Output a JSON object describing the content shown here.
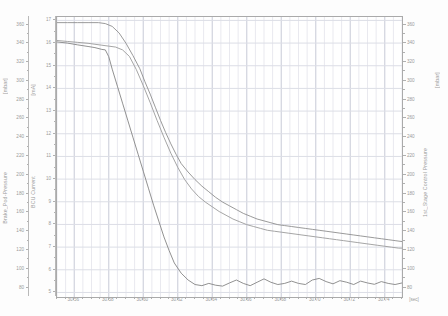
{
  "chart_data": {
    "type": "line",
    "title": "",
    "xlabel": "[sec]",
    "xlim": [
      30.55,
      30.75
    ],
    "x_ticks": [
      "30.56",
      "30.58",
      "30.60",
      "30.62",
      "30.64",
      "30.66",
      "30.68",
      "30.70",
      "30.72",
      "30.74"
    ],
    "x_tick_values": [
      30.56,
      30.58,
      30.6,
      30.62,
      30.64,
      30.66,
      30.68,
      30.7,
      30.72,
      30.74
    ],
    "x_minor_step": 0.005,
    "grid": true,
    "legend": "none",
    "axes": [
      {
        "id": "left-outer",
        "name": "Brake_Pod-Pressure",
        "label": "Brake_Pod-Pressure",
        "unit": "[mbar]",
        "side": "left",
        "lim": [
          70,
          368
        ],
        "ticks": [
          360,
          340,
          320,
          300,
          280,
          260,
          240,
          220,
          200,
          180,
          160,
          140,
          120,
          100,
          80
        ],
        "tick_labels": [
          "360",
          "340",
          "320",
          "300",
          "280",
          "260",
          "240",
          "220",
          "200",
          "180",
          "160",
          "140",
          "120",
          "100",
          "80"
        ]
      },
      {
        "id": "left-inner",
        "name": "BCU Current",
        "label": "BCU Current",
        "unit": "[mA]",
        "side": "left",
        "lim": [
          4.8,
          17.15
        ],
        "ticks": [
          17,
          16,
          15,
          14,
          13,
          12,
          11,
          10,
          9,
          8,
          7,
          6,
          5
        ],
        "tick_labels": [
          "17",
          "16",
          "15",
          "14",
          "13",
          "12",
          "11",
          "10",
          "9",
          "8",
          "7",
          "6",
          "5"
        ]
      },
      {
        "id": "right",
        "name": "1st_Stage Control Pressure",
        "label": "1st_Stage Control Pressure",
        "unit": "[mbar]",
        "side": "right",
        "lim": [
          70,
          368
        ],
        "ticks": [
          360,
          340,
          320,
          300,
          280,
          260,
          240,
          220,
          200,
          180,
          160,
          140,
          120,
          100,
          80
        ],
        "tick_labels": [
          "360",
          "340",
          "320",
          "300",
          "280",
          "260",
          "240",
          "220",
          "200",
          "180",
          "160",
          "140",
          "120",
          "100",
          "80"
        ]
      }
    ],
    "series": [
      {
        "name": "Brake_Pod-Pressure",
        "axis": "left-outer",
        "color": "#8e8e8e",
        "x": [
          30.55,
          30.556,
          30.562,
          30.568,
          30.574,
          30.578,
          30.582,
          30.586,
          30.59,
          30.594,
          30.598,
          30.601,
          30.604,
          30.607,
          30.61,
          30.613,
          30.616,
          30.619,
          30.622,
          30.626,
          30.63,
          30.634,
          30.638,
          30.642,
          30.646,
          30.65,
          30.654,
          30.658,
          30.662,
          30.666,
          30.67,
          30.674,
          30.678,
          30.682,
          30.686,
          30.69,
          30.694,
          30.698,
          30.702,
          30.706,
          30.71,
          30.714,
          30.718,
          30.722,
          30.726,
          30.73,
          30.734,
          30.738,
          30.742,
          30.746,
          30.75
        ],
        "y": [
          362,
          362,
          362,
          362,
          362,
          361,
          358,
          351,
          340,
          327,
          313,
          299,
          286,
          272,
          258,
          245,
          233,
          222,
          212,
          203,
          195,
          188,
          182,
          176,
          171,
          167,
          163,
          159,
          156,
          153,
          151,
          149,
          147,
          146,
          145,
          144,
          143,
          142,
          141,
          140,
          139,
          138,
          137,
          136,
          135,
          134,
          133,
          132,
          131,
          130,
          129
        ]
      },
      {
        "name": "1st_Stage Control Pressure",
        "axis": "right",
        "color": "#9b9b9b",
        "x": [
          30.55,
          30.556,
          30.562,
          30.568,
          30.572,
          30.576,
          30.58,
          30.584,
          30.588,
          30.592,
          30.596,
          30.6,
          30.604,
          30.608,
          30.612,
          30.616,
          30.62,
          30.624,
          30.628,
          30.632,
          30.636,
          30.64,
          30.644,
          30.648,
          30.652,
          30.656,
          30.66,
          30.664,
          30.668,
          30.672,
          30.676,
          30.68,
          30.684,
          30.688,
          30.692,
          30.696,
          30.7,
          30.704,
          30.708,
          30.712,
          30.716,
          30.72,
          30.724,
          30.728,
          30.732,
          30.736,
          30.74,
          30.744,
          30.748,
          30.75
        ],
        "y": [
          343,
          342,
          341,
          340,
          339,
          338,
          337,
          336,
          333,
          326,
          312,
          295,
          277,
          258,
          240,
          223,
          208,
          195,
          185,
          177,
          171,
          166,
          161,
          157,
          153,
          150,
          147,
          145,
          143,
          141,
          140,
          139,
          138,
          137,
          136,
          135,
          134,
          133,
          132,
          131,
          130,
          129,
          128,
          127,
          126,
          125,
          124,
          123,
          122,
          122
        ]
      },
      {
        "name": "BCU Current",
        "axis": "left-inner",
        "color": "#858585",
        "x": [
          30.55,
          30.556,
          30.562,
          30.568,
          30.572,
          30.576,
          30.578,
          30.58,
          30.582,
          30.585,
          30.588,
          30.591,
          30.594,
          30.597,
          30.6,
          30.603,
          30.606,
          30.609,
          30.612,
          30.615,
          30.618,
          30.622,
          30.626,
          30.63,
          30.634,
          30.638,
          30.642,
          30.646,
          30.65,
          30.654,
          30.658,
          30.662,
          30.666,
          30.67,
          30.674,
          30.678,
          30.682,
          30.686,
          30.69,
          30.694,
          30.698,
          30.702,
          30.706,
          30.71,
          30.714,
          30.718,
          30.722,
          30.726,
          30.73,
          30.734,
          30.738,
          30.742,
          30.746,
          30.75
        ],
        "y": [
          16.05,
          16.0,
          15.92,
          15.85,
          15.8,
          15.72,
          15.7,
          15.4,
          14.85,
          14.1,
          13.35,
          12.6,
          11.85,
          11.1,
          10.35,
          9.6,
          8.85,
          8.15,
          7.45,
          6.85,
          6.3,
          5.85,
          5.55,
          5.35,
          5.3,
          5.4,
          5.32,
          5.28,
          5.42,
          5.55,
          5.4,
          5.3,
          5.45,
          5.6,
          5.45,
          5.35,
          5.4,
          5.5,
          5.4,
          5.35,
          5.55,
          5.62,
          5.48,
          5.38,
          5.52,
          5.45,
          5.35,
          5.5,
          5.42,
          5.36,
          5.48,
          5.4,
          5.35,
          5.42
        ]
      }
    ]
  }
}
